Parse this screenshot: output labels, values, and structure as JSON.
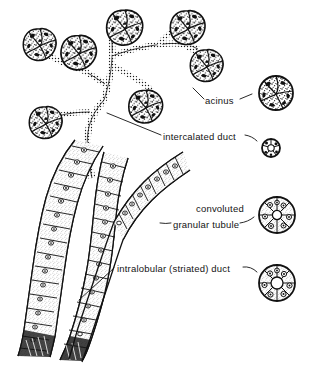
{
  "figure": {
    "ink_color": "#111111",
    "background_color": "#ffffff",
    "stipple_color": "#9a9a9a"
  },
  "labels": {
    "acinus": "acinus",
    "intercalated_duct": "intercalated duct",
    "convoluted": "convoluted",
    "granular_tubule": "granular tubule",
    "intralobular_striated_duct": "intralobular (striated) duct"
  },
  "caption": {
    "text": ""
  },
  "structures": {
    "acini_count": 7,
    "inset_count": 4,
    "inset_names": [
      "acinus-cross-section",
      "intercalated-duct-cross-section",
      "granular-tubule-cross-section",
      "striated-duct-cross-section"
    ]
  }
}
